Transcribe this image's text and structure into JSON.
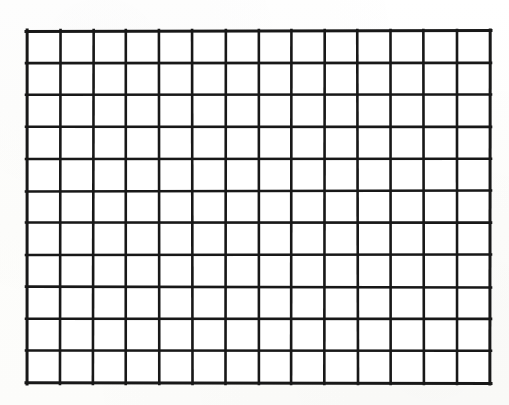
{
  "document": {
    "kind": "blank-grid-worksheet",
    "title": "Blank Grid",
    "background_color": "#fdfdfc",
    "has_text": false,
    "has_labels": false,
    "annotations": []
  },
  "canvas": {
    "width": 509,
    "height": 405
  },
  "grid": {
    "columns": 14,
    "rows": 11,
    "cell_count": 154,
    "x_start": 27,
    "y_start": 31,
    "x_end": 490,
    "y_end": 383,
    "width": 463,
    "height": 352,
    "cell_width": 33.07,
    "cell_height": 32.0,
    "line_color": "#181818",
    "line_width": 2.6,
    "border_width": 3.0,
    "cell_fill": "#ffffff"
  },
  "chart_data": {
    "type": "table",
    "title": "",
    "subtitle": "",
    "xlabel": "",
    "ylabel": "",
    "columns": 14,
    "rows": 11,
    "column_headers": [],
    "row_headers": [],
    "values": [
      [
        "",
        "",
        "",
        "",
        "",
        "",
        "",
        "",
        "",
        "",
        "",
        "",
        "",
        ""
      ],
      [
        "",
        "",
        "",
        "",
        "",
        "",
        "",
        "",
        "",
        "",
        "",
        "",
        "",
        ""
      ],
      [
        "",
        "",
        "",
        "",
        "",
        "",
        "",
        "",
        "",
        "",
        "",
        "",
        "",
        ""
      ],
      [
        "",
        "",
        "",
        "",
        "",
        "",
        "",
        "",
        "",
        "",
        "",
        "",
        "",
        ""
      ],
      [
        "",
        "",
        "",
        "",
        "",
        "",
        "",
        "",
        "",
        "",
        "",
        "",
        "",
        ""
      ],
      [
        "",
        "",
        "",
        "",
        "",
        "",
        "",
        "",
        "",
        "",
        "",
        "",
        "",
        ""
      ],
      [
        "",
        "",
        "",
        "",
        "",
        "",
        "",
        "",
        "",
        "",
        "",
        "",
        "",
        ""
      ],
      [
        "",
        "",
        "",
        "",
        "",
        "",
        "",
        "",
        "",
        "",
        "",
        "",
        "",
        ""
      ],
      [
        "",
        "",
        "",
        "",
        "",
        "",
        "",
        "",
        "",
        "",
        "",
        "",
        "",
        ""
      ],
      [
        "",
        "",
        "",
        "",
        "",
        "",
        "",
        "",
        "",
        "",
        "",
        "",
        "",
        ""
      ],
      [
        "",
        "",
        "",
        "",
        "",
        "",
        "",
        "",
        "",
        "",
        "",
        "",
        "",
        ""
      ]
    ],
    "grid": true,
    "legend": false,
    "legend_position": "none"
  }
}
